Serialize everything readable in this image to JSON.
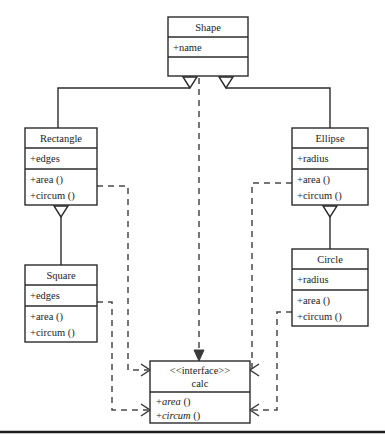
{
  "diagram": {
    "kind": "uml-class-diagram",
    "colors": {
      "stroke": "#2b2b2b",
      "dashed_stroke": "#4a4a4a",
      "background": "#ffffff",
      "text": "#1c1c1c"
    },
    "classes": {
      "shape": {
        "name": "Shape",
        "attributes": [
          "+name"
        ],
        "operations": []
      },
      "rectangle": {
        "name": "Rectangle",
        "attributes": [
          "+edges"
        ],
        "operations": [
          "+area ()",
          "+circum ()"
        ]
      },
      "ellipse": {
        "name": "Ellipse",
        "attributes": [
          "+radius"
        ],
        "operations": [
          "+area ()",
          "+circum ()"
        ]
      },
      "square": {
        "name": "Square",
        "attributes": [
          "+edges"
        ],
        "operations": [
          "+area ()",
          "+circum ()"
        ]
      },
      "circle": {
        "name": "Circle",
        "attributes": [
          "+radius"
        ],
        "operations": [
          "+area ()",
          "+circum ()"
        ]
      },
      "calc": {
        "stereotype": "<<interface>>",
        "name": "calc",
        "operations_prefix": [
          "+",
          "+"
        ],
        "operations_italic": [
          "area",
          "circum"
        ],
        "operations_suffix": [
          "()",
          "()"
        ],
        "operations": [
          "+area ()",
          "+circum ()"
        ]
      }
    },
    "relationships": [
      {
        "type": "generalization",
        "from": "Rectangle",
        "to": "Shape"
      },
      {
        "type": "generalization",
        "from": "Ellipse",
        "to": "Shape"
      },
      {
        "type": "generalization",
        "from": "Square",
        "to": "Rectangle"
      },
      {
        "type": "generalization",
        "from": "Circle",
        "to": "Ellipse"
      },
      {
        "type": "realization",
        "from": "Shape",
        "to": "calc"
      },
      {
        "type": "realization",
        "from": "Rectangle",
        "to": "calc"
      },
      {
        "type": "realization",
        "from": "Square",
        "to": "calc"
      },
      {
        "type": "realization",
        "from": "Ellipse",
        "to": "calc"
      },
      {
        "type": "realization",
        "from": "Circle",
        "to": "calc"
      }
    ]
  }
}
